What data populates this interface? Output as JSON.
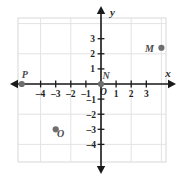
{
  "chart_data": {
    "type": "scatter",
    "title": "",
    "xlabel": "x",
    "ylabel": "y",
    "xlim": [
      -5.5,
      4.5
    ],
    "ylim": [
      -4.6,
      3.8
    ],
    "grid": true,
    "legend": "none",
    "x_ticks": [
      -4,
      -3,
      -2,
      -1,
      1,
      2,
      3
    ],
    "x_tick_labels": [
      "–4",
      "–3",
      "–2",
      "–1",
      "1",
      "2",
      "3"
    ],
    "y_ticks": [
      3,
      2,
      1,
      -1,
      -2,
      -3,
      -4
    ],
    "y_tick_labels": [
      "3",
      "2",
      "1",
      "–1",
      "–2",
      "–3",
      "–4"
    ],
    "origin_label": "O",
    "points": [
      {
        "label": "M",
        "x": 4,
        "y": 2.4,
        "label_dx": -12,
        "label_dy": 4
      },
      {
        "label": "N",
        "x": 0,
        "y": 0,
        "label_dx": 5,
        "label_dy": -5
      },
      {
        "label": "O",
        "x": -3,
        "y": -3,
        "label_dx": 5,
        "label_dy": 8
      },
      {
        "label": "P",
        "x": -5.25,
        "y": 0,
        "label_dx": 3,
        "label_dy": -6
      }
    ]
  },
  "colors": {
    "point": "#6e6e6e",
    "axis": "#1a1a1a",
    "grid": "#e3e3e3",
    "grid_major": "#d8d8d8",
    "text": "#1f1f1f",
    "label_text": "#4a4a4a",
    "background": "#ffffff"
  },
  "axis_labels": {
    "x": "x",
    "y": "y"
  }
}
